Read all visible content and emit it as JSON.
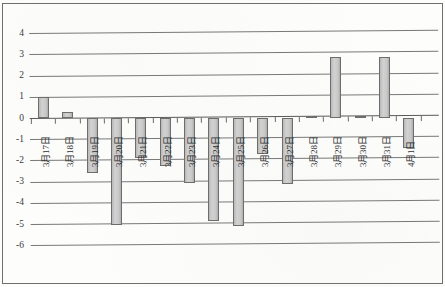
{
  "chart_data": {
    "type": "bar",
    "title": "",
    "xlabel": "",
    "ylabel": "",
    "ylim": [
      -6,
      4
    ],
    "grid": true,
    "legend": "none",
    "categories": [
      "3月17日",
      "3月18日",
      "3月19日",
      "3月20日",
      "3月21日",
      "3月22日",
      "3月23日",
      "3月24日",
      "3月25日",
      "3月26日",
      "3月27日",
      "3月28日",
      "3月29日",
      "3月30日",
      "3月31日",
      "4月1日"
    ],
    "values": [
      1.0,
      0.3,
      -2.6,
      -5.05,
      -1.9,
      -2.25,
      -3.05,
      -4.85,
      -5.1,
      -1.7,
      -3.1,
      0.1,
      2.9,
      0.1,
      2.9,
      -1.4
    ],
    "y_ticks": [
      4,
      3,
      2,
      1,
      0,
      -1,
      -2,
      -3,
      -4,
      -5,
      -6
    ],
    "y_tick_labels": [
      "4",
      "3",
      "2",
      "1",
      "0",
      "-1",
      "-2",
      "-3",
      "-4",
      "-5",
      "-6"
    ],
    "series": [
      {
        "name": "",
        "values": [
          1.0,
          0.3,
          -2.6,
          -5.05,
          -1.9,
          -2.25,
          -3.05,
          -4.85,
          -5.1,
          -1.7,
          -3.1,
          0.1,
          2.9,
          0.1,
          2.9,
          -1.4
        ],
        "color": "#c9c9c9",
        "edge_color": "#6d6d6d"
      }
    ]
  }
}
